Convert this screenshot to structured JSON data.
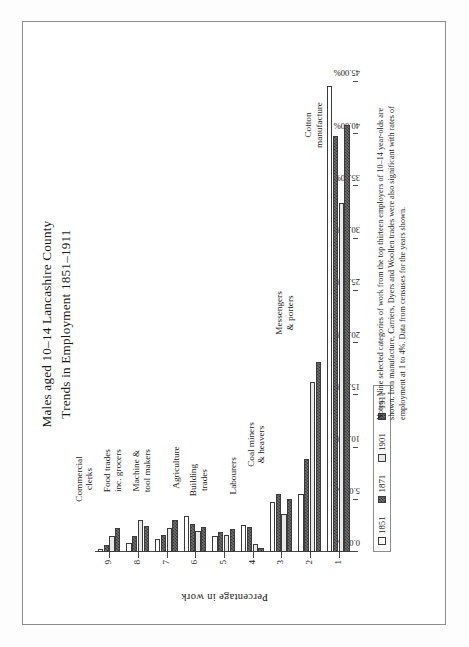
{
  "figure": {
    "title_line1": "Males aged 10–14 Lancashire County",
    "title_line2": "Trends in Employment 1851–1911",
    "axis_title": "Percentage in work",
    "frame_color": "#8d8d8d",
    "axis_color": "#4a4a4a",
    "bar_outline": "#3b3b3b"
  },
  "legend": {
    "items": [
      {
        "label": "1851",
        "swatch": "white",
        "color": "#ffffff"
      },
      {
        "label": "1871",
        "swatch": "hatch",
        "color": "#6f6f6f"
      },
      {
        "label": "1901",
        "swatch": "light",
        "color": "#e8e8e8"
      },
      {
        "label": "1911",
        "swatch": "hatch",
        "color": "#6f6f6f"
      }
    ]
  },
  "chart_data": {
    "type": "bar",
    "orientation": "horizontal",
    "title": "Males aged 10–14 Lancashire County Trends in Employment 1851–1911",
    "xlabel": "Percentage in work",
    "ylabel": "",
    "xlim": [
      0,
      45
    ],
    "grid": false,
    "legend_position": "bottom-left",
    "tick_labels": [
      "45.00%",
      "40.00%",
      "35.00%",
      "30.00%",
      "25.00%",
      "20.00%",
      "15.00%",
      "10.00%",
      "5.00%",
      "0.00%"
    ],
    "tick_values": [
      45,
      40,
      35,
      30,
      25,
      20,
      15,
      10,
      5,
      0
    ],
    "category_numbers": [
      "1",
      "2",
      "3",
      "4",
      "5",
      "6",
      "7",
      "8",
      "9"
    ],
    "categories": [
      "Cotton manufacture",
      "Messengers & porters",
      "Coal miners & heavers",
      "Labourers",
      "Building trades",
      "Agriculture",
      "Machine & tool makers",
      "Food trades inc. grocers",
      "Commercial clerks"
    ],
    "category_label_lines": [
      [
        "Cotton",
        "manufacture"
      ],
      [
        "Messengers",
        "& porters"
      ],
      [
        "Coal miners",
        "& heavers"
      ],
      [
        "Labourers",
        ""
      ],
      [
        "Building",
        "trades"
      ],
      [
        "Agriculture",
        ""
      ],
      [
        "Machine &",
        "tool makers"
      ],
      [
        "Food trades",
        "inc. grocers"
      ],
      [
        "Commercial",
        "clerks"
      ]
    ],
    "series": [
      {
        "name": "1851",
        "values": [
          44.6,
          5.6,
          4.8,
          2.6,
          1.5,
          3.4,
          1.2,
          0.9,
          0.3
        ]
      },
      {
        "name": "1871",
        "values": [
          39.8,
          8.9,
          5.6,
          2.4,
          1.9,
          2.7,
          1.6,
          1.5,
          0.7
        ]
      },
      {
        "name": "1901",
        "values": [
          33.4,
          16.3,
          3.6,
          0.8,
          1.6,
          2.0,
          2.3,
          3.1,
          1.5
        ]
      },
      {
        "name": "1911",
        "values": [
          40.9,
          18.2,
          5.1,
          0.4,
          2.2,
          2.4,
          3.1,
          2.5,
          2.3
        ]
      }
    ]
  }
}
